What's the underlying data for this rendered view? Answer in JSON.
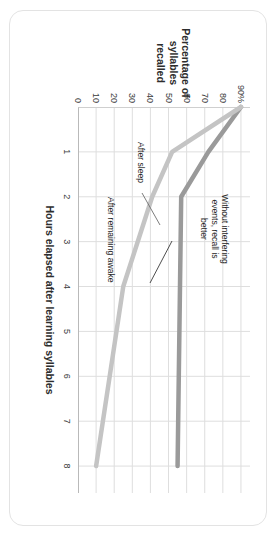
{
  "chart_data": {
    "type": "line",
    "title": "",
    "xlabel": "Hours elapsed after learning syllables",
    "ylabel": "Percentage of\nsyllables\nrecalled",
    "ylabel_lines": [
      "Percentage of",
      "syllables",
      "recalled"
    ],
    "xlim": [
      0,
      8.6
    ],
    "ylim": [
      0,
      95
    ],
    "grid": true,
    "legend_position": "none",
    "xticks": [
      1,
      2,
      3,
      4,
      5,
      6,
      7,
      8
    ],
    "xtick_labels": [
      "1",
      "2",
      "3",
      "4",
      "5",
      "6",
      "7",
      "8"
    ],
    "yticks": [
      0,
      10,
      20,
      30,
      40,
      50,
      60,
      70,
      80,
      90
    ],
    "ytick_labels": [
      "0",
      "10",
      "20",
      "30",
      "40",
      "50",
      "60",
      "70",
      "80",
      "90%"
    ],
    "series": [
      {
        "name": "After sleep",
        "color": "#9a9a9a",
        "x": [
          0,
          1,
          2,
          8
        ],
        "values": [
          90,
          72,
          57,
          55
        ]
      },
      {
        "name": "After remaining awake",
        "color": "#c4c4c4",
        "x": [
          0,
          1,
          2,
          4,
          8
        ],
        "values": [
          90,
          52,
          41,
          25,
          10
        ]
      }
    ],
    "annotations": [
      {
        "name": "headline",
        "text": "Without interfering\nevents, recall is\nbetter"
      },
      {
        "name": "after-sleep",
        "text": "After sleep"
      },
      {
        "name": "after-remaining-awake",
        "text": "After remaining awake"
      }
    ]
  },
  "colors": {
    "series_sleep": "#9a9a9a",
    "series_awake": "#c4c4c4",
    "grid": "#dedede",
    "axis": "#b9b9b9",
    "text": "#2d2d2d",
    "card_border": "#e3e3e3",
    "background": "#ffffff"
  }
}
